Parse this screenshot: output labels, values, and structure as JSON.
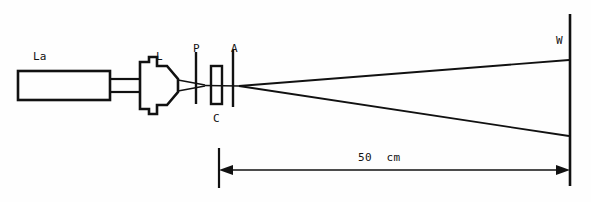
{
  "diagram": {
    "type": "optical-ray-diagram",
    "background_color": "#fefefe",
    "line_color": "#111111",
    "components": [
      {
        "key": "laser",
        "label": "La",
        "description": "laser source body",
        "label_x": 33,
        "label_y": 51
      },
      {
        "key": "lens",
        "label": "L",
        "description": "beam expanding lens housing",
        "label_x": 156,
        "label_y": 51
      },
      {
        "key": "polarizer",
        "label": "P",
        "description": "polarizer plate",
        "label_x": 193,
        "label_y": 43
      },
      {
        "key": "cell",
        "label": "C",
        "description": "sample cell / cuvette",
        "label_x": 215,
        "label_y": 113
      },
      {
        "key": "analyzer",
        "label": "A",
        "description": "analyzer plate",
        "label_x": 232,
        "label_y": 43
      },
      {
        "key": "wall",
        "label": "W",
        "description": "observation screen or wall",
        "label_x": 556,
        "label_y": 35
      }
    ],
    "dimension": {
      "value": "50",
      "unit": "cm",
      "text": "50  cm",
      "label_x": 358,
      "label_y": 152,
      "from_x": 219,
      "to_x": 569,
      "line_y": 170
    }
  }
}
